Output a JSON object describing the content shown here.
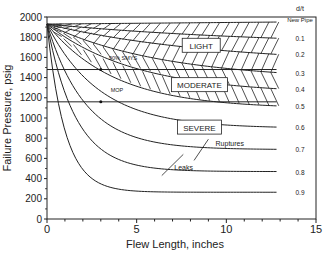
{
  "chart_data": {
    "type": "line",
    "title": "",
    "xlabel": "Flew Length, inches",
    "ylabel": "Failure Pressure, psig",
    "xlim": [
      0,
      15
    ],
    "ylim": [
      0,
      2000
    ],
    "xticks": [
      0,
      5,
      10,
      15
    ],
    "yticks": [
      0,
      200,
      400,
      600,
      800,
      1000,
      1200,
      1400,
      1600,
      1800,
      2000
    ],
    "grid": false,
    "legend": "right-side labels (d/t)",
    "right_header": "d/t",
    "origin": [
      0,
      1930
    ],
    "curve_end_x": 12.8,
    "series": [
      {
        "name": "New Pipe",
        "end_y": 1950,
        "k": 0.0
      },
      {
        "name": "0.1",
        "end_y": 1790,
        "k": 0.25
      },
      {
        "name": "0.2",
        "end_y": 1630,
        "k": 0.35
      },
      {
        "name": "0.3",
        "end_y": 1450,
        "k": 0.5
      },
      {
        "name": "0.4",
        "end_y": 1290,
        "k": 0.65
      },
      {
        "name": "0.5",
        "end_y": 1120,
        "k": 0.85
      },
      {
        "name": "0.6",
        "end_y": 910,
        "k": 1.1
      },
      {
        "name": "0.7",
        "end_y": 690,
        "k": 1.5
      },
      {
        "name": "0.8",
        "end_y": 470,
        "k": 2.0
      },
      {
        "name": "0.9",
        "end_y": 265,
        "k": 3.2
      }
    ],
    "reference_lines": [
      {
        "name": "90% SMYS",
        "y": 1480,
        "label_x": 3.9,
        "marker_x": 3.0
      },
      {
        "name": "MOP",
        "y": 1160,
        "label_x": 4.0,
        "marker_x": 3.0
      }
    ],
    "regions": [
      {
        "name": "LIGHT",
        "x": 8.6,
        "y": 1720
      },
      {
        "name": "MODERATE",
        "x": 8.5,
        "y": 1330
      },
      {
        "name": "SEVERE",
        "x": 8.5,
        "y": 910
      }
    ],
    "annotations": [
      {
        "text": "Ruptures",
        "x": 9.4,
        "y": 720
      },
      {
        "text": "Leaks",
        "x": 7.1,
        "y": 490
      }
    ]
  }
}
